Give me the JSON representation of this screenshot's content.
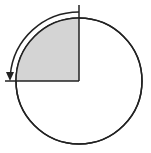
{
  "diagram": {
    "shaded_fraction": 0.25,
    "shaded_quadrant": "upper-left",
    "rotation_direction": "counterclockwise",
    "rotation_degrees": 90,
    "colors": {
      "stroke": "#222222",
      "shade": "#d4d4d4",
      "background": "#ffffff"
    }
  }
}
